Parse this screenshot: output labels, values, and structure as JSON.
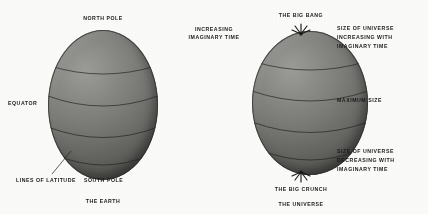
{
  "figure": {
    "background_color": "#fbfbf9",
    "ink_color": "#1a1a1a",
    "sphere_color": "#7e7e7b"
  },
  "earth": {
    "caption": "THE EARTH",
    "labels": {
      "north_pole": "NORTH POLE",
      "equator": "EQUATOR",
      "south_pole": "SOUTH POLE",
      "lines_of_latitude": "LINES OF LATITUDE"
    }
  },
  "universe": {
    "caption": "THE UNIVERSE",
    "labels": {
      "big_bang": "THE BIG BANG",
      "big_crunch": "THE BIG CRUNCH",
      "maximum_size": "MAXIMUM SIZE",
      "increasing_imaginary_time_line1": "INCREASING",
      "increasing_imaginary_time_line2": "IMAGINARY TIME",
      "size_increasing_line1": "SIZE OF UNIVERSE",
      "size_increasing_line2": "INCREASING WITH",
      "size_increasing_line3": "IMAGINARY TIME",
      "size_decreasing_line1": "SIZE OF UNIVERSE",
      "size_decreasing_line2": "DECREASING WITH",
      "size_decreasing_line3": "IMAGINARY TIME"
    }
  }
}
